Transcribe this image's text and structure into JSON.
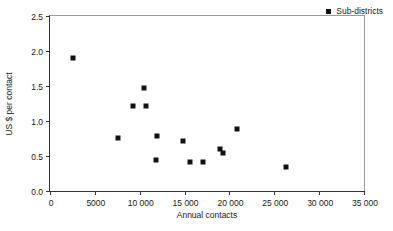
{
  "chart_data": {
    "type": "scatter",
    "title": "",
    "xlabel": "Annual contacts",
    "ylabel": "US $ per contact",
    "xlim": [
      0,
      35000
    ],
    "ylim": [
      0,
      2.5
    ],
    "grid": false,
    "legend_position": "top-right",
    "xticks": [
      0,
      5000,
      10000,
      15000,
      20000,
      25000,
      30000,
      35000
    ],
    "xticklabels": [
      "0",
      "5000",
      "10 000",
      "15 000",
      "20 000",
      "25 000",
      "30 000",
      "35 000"
    ],
    "yticks": [
      0.0,
      0.5,
      1.0,
      1.5,
      2.0,
      2.5
    ],
    "yticklabels": [
      "0.0",
      "0.5",
      "1.0",
      "1.5",
      "2.0",
      "2.5"
    ],
    "series": [
      {
        "name": "Sub-districts",
        "marker": "filled-square",
        "color": "#111111",
        "points": [
          {
            "x": 2600,
            "y": 1.9
          },
          {
            "x": 7600,
            "y": 0.76
          },
          {
            "x": 9200,
            "y": 1.21
          },
          {
            "x": 10500,
            "y": 1.47
          },
          {
            "x": 10700,
            "y": 1.21
          },
          {
            "x": 11900,
            "y": 0.79
          },
          {
            "x": 11800,
            "y": 0.44
          },
          {
            "x": 14800,
            "y": 0.72
          },
          {
            "x": 15600,
            "y": 0.42
          },
          {
            "x": 17100,
            "y": 0.42
          },
          {
            "x": 19000,
            "y": 0.6
          },
          {
            "x": 19300,
            "y": 0.55
          },
          {
            "x": 20800,
            "y": 0.88
          },
          {
            "x": 26300,
            "y": 0.35
          }
        ]
      }
    ],
    "legend": [
      {
        "label": "Sub-districts",
        "marker": "filled-square",
        "color": "#111111"
      }
    ]
  }
}
